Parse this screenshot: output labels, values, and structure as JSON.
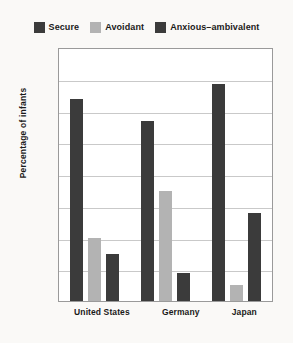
{
  "chart_data": {
    "type": "bar",
    "title": "",
    "xlabel": "",
    "ylabel": "Percentage of infants",
    "categories": [
      "United States",
      "Germany",
      "Japan"
    ],
    "series": [
      {
        "name": "Secure",
        "color": "#3b3b3b",
        "values": [
          64,
          57,
          69
        ]
      },
      {
        "name": "Avoidant",
        "color": "#b3b3b3",
        "values": [
          20,
          35,
          5
        ]
      },
      {
        "name": "Anxious–ambivalent",
        "color": "#3b3b3b",
        "values": [
          15,
          9,
          28
        ]
      }
    ],
    "ylim": [
      0,
      80
    ],
    "ytick_labels": [
      "80",
      "70",
      "60",
      "50",
      "40",
      "30",
      "20",
      "10",
      "0"
    ],
    "ytick_values": [
      80,
      70,
      60,
      50,
      40,
      30,
      20,
      10,
      0
    ],
    "grid": true,
    "legend_position": "top"
  },
  "legend": {
    "entries": [
      {
        "label": "Secure",
        "swatch": "legend-swatch-secure"
      },
      {
        "label": "Avoidant",
        "swatch": "legend-swatch-avoidant"
      },
      {
        "label": "Anxious–ambivalent",
        "swatch": "legend-swatch-anxious-ambivalent"
      }
    ]
  },
  "colors": {
    "secure": "#3b3b3b",
    "avoidant": "#b3b3b3",
    "anxious_ambivalent": "#3b3b3b",
    "page_background": "#faf9f7",
    "plot_background": "#ffffff",
    "gridline": "#c9c9c9",
    "axis": "#9a9a9a"
  }
}
